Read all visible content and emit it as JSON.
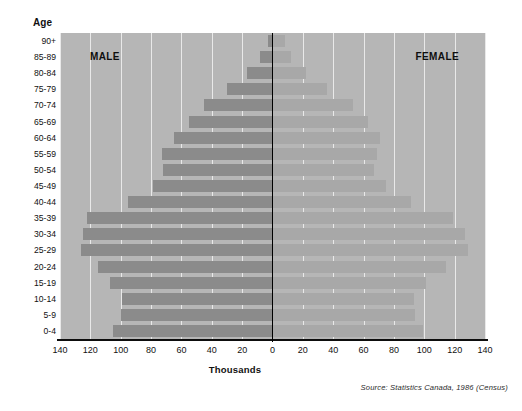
{
  "axis": {
    "y_title": "Age",
    "x_title": "Thousands"
  },
  "series_labels": {
    "male": "MALE",
    "female": "FEMALE"
  },
  "source_note": "Source: Statistics Canada, 1986 (Census)",
  "colors": {
    "background": "#b6b6b6",
    "male_bar": "#8b8b8b",
    "female_bar": "#a8a8a8",
    "gridline": "#e9e9e9",
    "axis": "#000000"
  },
  "chart_data": {
    "type": "bar",
    "subtype": "population-pyramid",
    "title": "",
    "subtitle": "",
    "xlabel": "Thousands",
    "ylabel": "Age",
    "orientation": "horizontal",
    "grid": true,
    "legend_position": "in-plot",
    "xlim": [
      -140,
      140
    ],
    "xticks": [
      140,
      120,
      100,
      80,
      60,
      40,
      20,
      0,
      20,
      40,
      60,
      80,
      100,
      120,
      140
    ],
    "xtick_labels": [
      "140",
      "120",
      "100",
      "80",
      "60",
      "40",
      "20",
      "0",
      "20",
      "40",
      "60",
      "80",
      "100",
      "120",
      "140"
    ],
    "categories": [
      "90+",
      "85-89",
      "80-84",
      "75-79",
      "70-74",
      "65-69",
      "60-64",
      "55-59",
      "50-54",
      "45-49",
      "40-44",
      "35-39",
      "30-34",
      "25-29",
      "20-24",
      "15-19",
      "10-14",
      "5-9",
      "0-4"
    ],
    "series": [
      {
        "name": "MALE",
        "side": "left",
        "values": [
          3,
          8,
          17,
          30,
          45,
          55,
          65,
          73,
          72,
          79,
          95,
          122,
          125,
          126,
          115,
          107,
          99,
          100,
          105
        ]
      },
      {
        "name": "FEMALE",
        "side": "right",
        "values": [
          8,
          12,
          22,
          36,
          53,
          63,
          71,
          69,
          67,
          75,
          91,
          119,
          127,
          129,
          114,
          101,
          93,
          94,
          99
        ]
      }
    ]
  }
}
